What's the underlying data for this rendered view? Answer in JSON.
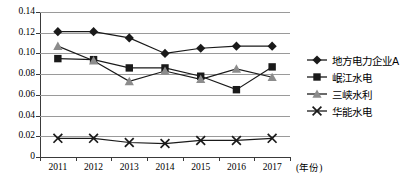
{
  "chart_data": {
    "type": "line",
    "title": "",
    "subtitle": "",
    "xlabel": "(年份)",
    "ylabel": "",
    "categories": [
      "2011",
      "2012",
      "2013",
      "2014",
      "2015",
      "2016",
      "2017"
    ],
    "ylim": [
      0,
      0.14
    ],
    "ytick_labels": [
      "0",
      "0.02",
      "0.04",
      "0.06",
      "0.08",
      "0.10",
      "0.12",
      "0.14"
    ],
    "ytick_values": [
      0,
      0.02,
      0.04,
      0.06,
      0.08,
      0.1,
      0.12,
      0.14
    ],
    "grid": true,
    "legend_position": "right",
    "series": [
      {
        "name": "地方电力企业A",
        "marker": "diamond",
        "color": "#1a1a1a",
        "values": [
          0.121,
          0.121,
          0.115,
          0.1,
          0.105,
          0.107,
          0.107
        ]
      },
      {
        "name": "岷江水电",
        "marker": "square",
        "color": "#1a1a1a",
        "values": [
          0.095,
          0.094,
          0.086,
          0.086,
          0.078,
          0.065,
          0.087
        ]
      },
      {
        "name": "三峡水利",
        "marker": "triangle",
        "color": "#8c8c8c",
        "values": [
          0.107,
          0.093,
          0.073,
          0.083,
          0.075,
          0.085,
          0.077
        ]
      },
      {
        "name": "华能水电",
        "marker": "cross",
        "color": "#1a1a1a",
        "values": [
          0.018,
          0.018,
          0.014,
          0.013,
          0.016,
          0.016,
          0.018
        ]
      }
    ]
  }
}
